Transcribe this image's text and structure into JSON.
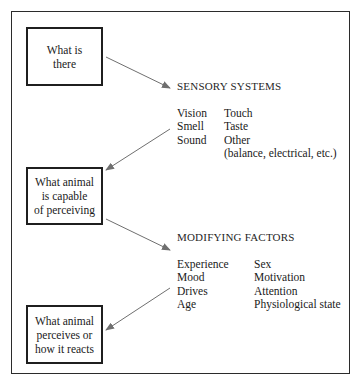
{
  "figure": {
    "boxes": [
      {
        "name": "what-is-there",
        "lines": [
          "What is",
          "there"
        ]
      },
      {
        "name": "what-animal-is-capable-of-perceiving",
        "lines": [
          "What animal",
          "is capable",
          "of perceiving"
        ]
      },
      {
        "name": "what-animal-perceives-or-how-it-reacts",
        "lines": [
          "What animal",
          "perceives or",
          "how it reacts"
        ]
      }
    ],
    "sections": [
      {
        "name": "sensory-systems",
        "heading": "SENSORY SYSTEMS",
        "col1": [
          "Vision",
          "Smell",
          "Sound"
        ],
        "col2": [
          "Touch",
          "Taste",
          "Other"
        ],
        "note": "(balance, electrical, etc.)"
      },
      {
        "name": "modifying-factors",
        "heading": "MODIFYING FACTORS",
        "col1": [
          "Experience",
          "Mood",
          "Drives",
          "Age"
        ],
        "col2": [
          "Sex",
          "Motivation",
          "Attention",
          "Physiological state"
        ],
        "note": ""
      }
    ],
    "arrows": [
      {
        "name": "arrow-what-is-there-to-sensory-systems",
        "from": "what-is-there",
        "to": "sensory-systems"
      },
      {
        "name": "arrow-sensory-systems-to-capable",
        "from": "sensory-systems",
        "to": "what-animal-is-capable-of-perceiving"
      },
      {
        "name": "arrow-capable-to-modifying-factors",
        "from": "what-animal-is-capable-of-perceiving",
        "to": "modifying-factors"
      },
      {
        "name": "arrow-modifying-factors-to-perceives",
        "from": "modifying-factors",
        "to": "what-animal-perceives-or-how-it-reacts"
      }
    ],
    "colors": {
      "frame": "#2b2b2b",
      "box_border": "#1f1f1f",
      "text": "#1a1a1a",
      "arrow": "#6f6f6f",
      "background": "#ffffff"
    }
  }
}
